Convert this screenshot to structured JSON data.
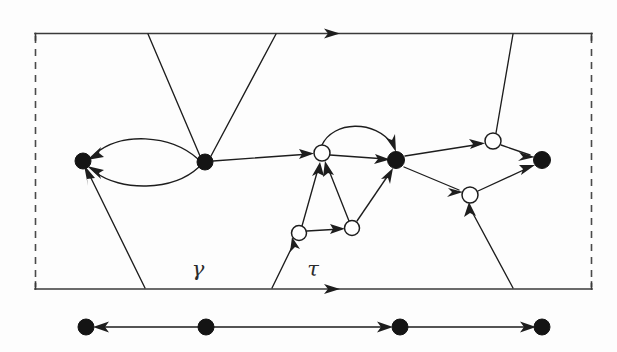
{
  "figure": {
    "background_color": "#fdfdfd",
    "ink_color": "#1d1d1d",
    "labels": {
      "gamma": "γ",
      "tau": "τ"
    },
    "cylinder": {
      "left": 35,
      "right": 592,
      "top": 33,
      "bottom": 289,
      "top_border_style": "solid-with-arrow",
      "bottom_border_style": "solid-with-arrow",
      "left_border_style": "dashed",
      "right_border_style": "dashed",
      "top_arrow_x": 332,
      "bottom_arrow_x": 332
    },
    "nodes": [
      {
        "id": "b1",
        "type": "filled",
        "cx": 83,
        "cy": 161,
        "r": 8
      },
      {
        "id": "b2",
        "type": "filled",
        "cx": 205,
        "cy": 162,
        "r": 8
      },
      {
        "id": "w1",
        "type": "hollow",
        "cx": 322,
        "cy": 153,
        "r": 8
      },
      {
        "id": "b3",
        "type": "filled",
        "cx": 396,
        "cy": 160,
        "r": 8.5
      },
      {
        "id": "w2",
        "type": "hollow",
        "cx": 493,
        "cy": 141,
        "r": 8
      },
      {
        "id": "w3",
        "type": "hollow",
        "cx": 470,
        "cy": 195,
        "r": 8
      },
      {
        "id": "b4",
        "type": "filled",
        "cx": 542,
        "cy": 160,
        "r": 8.5
      },
      {
        "id": "w4",
        "type": "hollow",
        "cx": 299,
        "cy": 233,
        "r": 7.5
      },
      {
        "id": "w5",
        "type": "hollow",
        "cx": 352,
        "cy": 228,
        "r": 7.5
      }
    ],
    "edges": [
      {
        "id": "e-b2-b1-upper",
        "from": "b2",
        "to": "b1",
        "shape": "curve-up",
        "arrow": "to"
      },
      {
        "id": "e-b2-b1-lower",
        "from": "b2",
        "to": "b1",
        "shape": "curve-down",
        "arrow": "to"
      },
      {
        "id": "e-b2-w1",
        "from": "b2",
        "to": "w1",
        "shape": "line",
        "arrow": "to"
      },
      {
        "id": "e-w1-b3-arc",
        "from": "w1",
        "to": "b3",
        "shape": "arc-over",
        "arrow": "to"
      },
      {
        "id": "e-w1-b3-line",
        "from": "w1",
        "to": "b3",
        "shape": "line",
        "arrow": "to"
      },
      {
        "id": "e-w4-w1",
        "from": "w4",
        "to": "w1",
        "shape": "line",
        "arrow": "to"
      },
      {
        "id": "e-w5-w1",
        "from": "w5",
        "to": "w1",
        "shape": "line",
        "arrow": "to"
      },
      {
        "id": "e-w4-w5",
        "from": "w4",
        "to": "w5",
        "shape": "line",
        "arrow": "to"
      },
      {
        "id": "e-w5-b3",
        "from": "w5",
        "to": "b3",
        "shape": "line",
        "arrow": "to"
      },
      {
        "id": "e-b3-w2",
        "from": "b3",
        "to": "w2",
        "shape": "line",
        "arrow": "to"
      },
      {
        "id": "e-b3-w3",
        "from": "b3",
        "to": "w3",
        "shape": "line",
        "arrow": "to"
      },
      {
        "id": "e-w2-b4",
        "from": "w2",
        "to": "b4",
        "shape": "line",
        "arrow": "to"
      },
      {
        "id": "e-w3-b4",
        "from": "w3",
        "to": "b4",
        "shape": "line",
        "arrow": "to"
      },
      {
        "id": "e-top-left-b2",
        "from": "top-boundary",
        "to": "b2",
        "shape": "line",
        "arrow": "none"
      },
      {
        "id": "e-top-right-b2",
        "from": "top-boundary",
        "to": "b2",
        "shape": "line",
        "arrow": "none"
      },
      {
        "id": "e-top-w2",
        "from": "top-boundary",
        "to": "w2",
        "shape": "line",
        "arrow": "none"
      },
      {
        "id": "e-bottom-b1",
        "from": "bottom-boundary",
        "to": "b1",
        "shape": "line",
        "arrow": "to"
      },
      {
        "id": "e-bottom-w4",
        "from": "bottom-boundary",
        "to": "w4",
        "shape": "line",
        "arrow": "to"
      },
      {
        "id": "e-bottom-w3",
        "from": "bottom-boundary",
        "to": "w3",
        "shape": "line",
        "arrow": "to"
      }
    ]
  },
  "boundary_circle": {
    "y": 327,
    "nodes": [
      {
        "id": "c1",
        "cx": 86,
        "cy": 327,
        "r": 8
      },
      {
        "id": "c2",
        "cx": 206,
        "cy": 327,
        "r": 8
      },
      {
        "id": "c3",
        "cx": 400,
        "cy": 327,
        "r": 8
      },
      {
        "id": "c4",
        "cx": 542,
        "cy": 327,
        "r": 8
      }
    ],
    "edges": [
      {
        "id": "bc-c2-c1",
        "from": "c2",
        "to": "c1",
        "direction": "left"
      },
      {
        "id": "bc-c2-c3",
        "from": "c2",
        "to": "c3",
        "direction": "right"
      },
      {
        "id": "bc-c3-c4",
        "from": "c3",
        "to": "c4",
        "direction": "right"
      }
    ]
  }
}
